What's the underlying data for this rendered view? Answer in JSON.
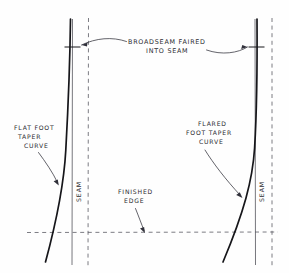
{
  "diagram": {
    "type": "hand-drawn technical sail panel diagram",
    "background_color": "#fefefe",
    "ink_color": "#16161a",
    "dash_color": "#5a5a63"
  },
  "labels": {
    "broadseam_line1": "BROADSEAM  FAIRED",
    "broadseam_line2": "INTO  SEAM",
    "flat_foot_line1": "FLAT  FOOT",
    "flat_foot_line2": "TAPER",
    "flat_foot_line3": "CURVE",
    "flared_foot_line1": "FLARED",
    "flared_foot_line2": "FOOT  TAPER",
    "flared_foot_line3": "CURVE",
    "finished_edge_line1": "FINISHED",
    "finished_edge_line2": "EDGE",
    "seam_left": "SEAM",
    "seam_right": "SEAM"
  },
  "elements": {
    "left_seam_line": "vertical-seam-line-left",
    "right_seam_line": "vertical-seam-line-right",
    "left_dashed_line": "vertical-dashed-guide-left",
    "right_dashed_line": "vertical-dashed-guide-right",
    "finished_edge_line": "horizontal-dashed-finished-edge",
    "left_curve": "flat-foot-taper-curve",
    "right_curve": "flared-foot-taper-curve",
    "left_tick": "broadseam-fair-point-left",
    "right_tick": "broadseam-fair-point-right"
  }
}
